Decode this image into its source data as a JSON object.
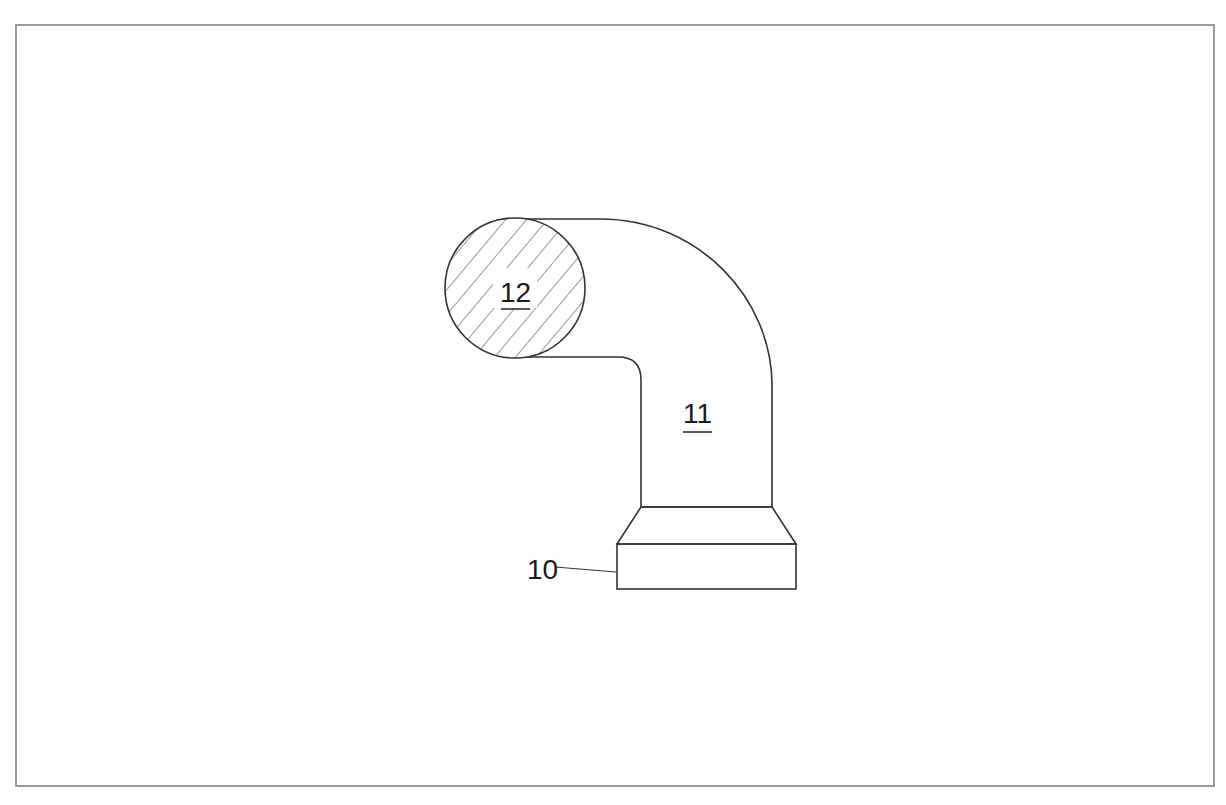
{
  "figure": {
    "type": "patent line drawing",
    "border_color": "#9a9a9a",
    "stroke_color": "#333333"
  },
  "labels": {
    "base": "10",
    "bend_tube": "11",
    "cross_section": "12"
  },
  "parts": [
    {
      "ref": "10",
      "description": "base block with tapered collar",
      "underlined": false,
      "leader_line": true
    },
    {
      "ref": "11",
      "description": "curved tubular body",
      "underlined": true,
      "leader_line": false
    },
    {
      "ref": "12",
      "description": "hatched circular cross-section",
      "underlined": true,
      "leader_line": false
    }
  ]
}
